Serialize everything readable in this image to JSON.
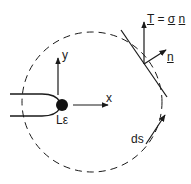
{
  "diagram": {
    "type": "crack-tip contour integral schematic",
    "labels": {
      "traction_T": "T",
      "traction_eq": "=",
      "traction_sigma": "σ",
      "traction_n": "n",
      "normal": "n",
      "y_axis": "y",
      "x_axis": "x",
      "tip_zone": "Lε",
      "path_element": "ds"
    },
    "colors": {
      "stroke": "#1a1a1a",
      "background": "#ffffff"
    }
  }
}
